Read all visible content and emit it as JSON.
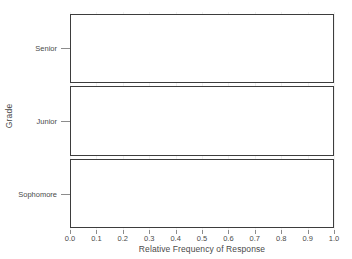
{
  "chart_data": {
    "type": "bar",
    "orientation": "horizontal",
    "title": "",
    "xlabel": "Relative Frequency of Response",
    "ylabel": "Grade",
    "categories": [
      "Senior",
      "Junior",
      "Sophomore"
    ],
    "values": [
      1.0,
      1.0,
      1.0
    ],
    "xlim": [
      0.0,
      1.0
    ],
    "xticks": [
      0.0,
      0.1,
      0.2,
      0.3,
      0.4,
      0.5,
      0.6,
      0.7,
      0.8,
      0.9,
      1.0
    ],
    "xtick_labels": [
      "0.0",
      "0.1",
      "0.2",
      "0.3",
      "0.4",
      "0.5",
      "0.6",
      "0.7",
      "0.8",
      "0.9",
      "1.0"
    ],
    "grid": true,
    "grid_axis": "x",
    "legend": false,
    "bar_fill_color": "#ffffff",
    "bar_edge_color": "#3d3d3d",
    "grid_color": "#f0f0f0",
    "text_color": "#4a4a4a",
    "background_color": "#ffffff"
  },
  "axes": {
    "y_title": "Grade",
    "x_title": "Relative Frequency of Response",
    "y_categories": [
      {
        "label": "Senior"
      },
      {
        "label": "Junior"
      },
      {
        "label": "Sophomore"
      }
    ],
    "x_ticks": [
      {
        "label": "0.0"
      },
      {
        "label": "0.1"
      },
      {
        "label": "0.2"
      },
      {
        "label": "0.3"
      },
      {
        "label": "0.4"
      },
      {
        "label": "0.5"
      },
      {
        "label": "0.6"
      },
      {
        "label": "0.7"
      },
      {
        "label": "0.8"
      },
      {
        "label": "0.9"
      },
      {
        "label": "1.0"
      }
    ]
  }
}
